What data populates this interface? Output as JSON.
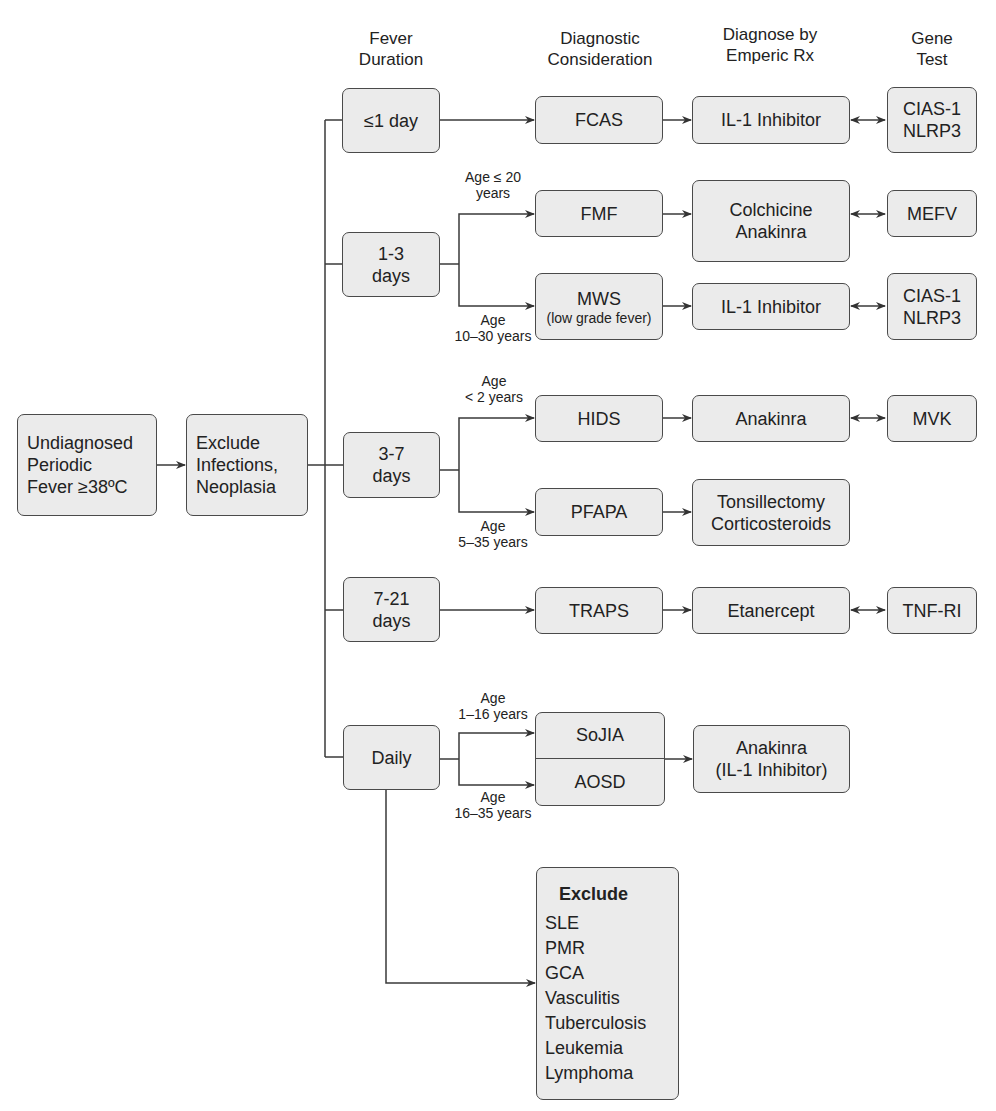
{
  "headers": {
    "fever_duration": [
      "Fever",
      "Duration"
    ],
    "diagnostic_consideration": [
      "Diagnostic",
      "Consideration"
    ],
    "diagnose_by_rx": [
      "Diagnose by",
      "Emperic Rx"
    ],
    "gene_test": [
      "Gene",
      "Test"
    ]
  },
  "start": {
    "undiagnosed": [
      "Undiagnosed",
      "Periodic",
      "Fever ≥38ºC"
    ],
    "exclude_infections": [
      "Exclude",
      "Infections,",
      "Neoplasia"
    ]
  },
  "durations": {
    "d1": [
      "≤1 day"
    ],
    "d1_3": [
      "1-3",
      "days"
    ],
    "d3_7": [
      "3-7",
      "days"
    ],
    "d7_21": [
      "7-21",
      "days"
    ],
    "daily": [
      "Daily"
    ]
  },
  "age_labels": {
    "fmf": [
      "Age ≤ 20",
      "years"
    ],
    "mws": [
      "Age",
      "10–30 years"
    ],
    "hids": [
      "Age",
      "< 2 years"
    ],
    "pfapa": [
      "Age",
      "5–35 years"
    ],
    "sojia": [
      "Age",
      "1–16 years"
    ],
    "aosd": [
      "Age",
      "16–35 years"
    ]
  },
  "diagnoses": {
    "fcas": "FCAS",
    "fmf": "FMF",
    "mws": "MWS",
    "mws_note": "(low grade fever)",
    "hids": "HIDS",
    "pfapa": "PFAPA",
    "traps": "TRAPS",
    "sojia": "SoJIA",
    "aosd": "AOSD"
  },
  "treatments": {
    "fcas": [
      "IL-1 Inhibitor"
    ],
    "fmf": [
      "Colchicine",
      "Anakinra"
    ],
    "mws": [
      "IL-1 Inhibitor"
    ],
    "hids": [
      "Anakinra"
    ],
    "pfapa": [
      "Tonsillectomy",
      "Corticosteroids"
    ],
    "traps": [
      "Etanercept"
    ],
    "sojia_aosd": [
      "Anakinra",
      "(IL-1 Inhibitor)"
    ]
  },
  "genes": {
    "fcas": [
      "CIAS-1",
      "NLRP3"
    ],
    "fmf": [
      "MEFV"
    ],
    "mws": [
      "CIAS-1",
      "NLRP3"
    ],
    "hids": [
      "MVK"
    ],
    "traps": [
      "TNF-RI"
    ]
  },
  "exclude_box": {
    "title": "Exclude",
    "items": [
      "SLE",
      "PMR",
      "GCA",
      "Vasculitis",
      "Tuberculosis",
      "Leukemia",
      "Lymphoma"
    ]
  },
  "colors": {
    "box_fill": "#ebebeb",
    "box_border": "#4a4a4a",
    "line": "#3a3a3a",
    "text": "#222222"
  }
}
